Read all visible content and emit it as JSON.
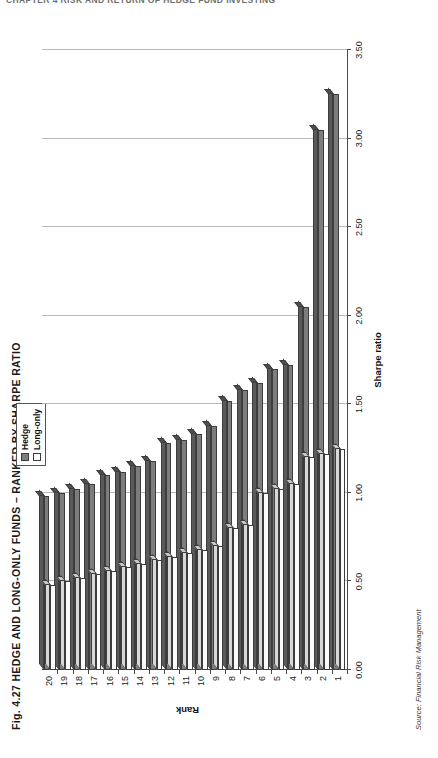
{
  "running_header": "CHAPTER 4  RISK AND RETURN OF HEDGE FUND INVESTING",
  "figure": {
    "title": "Fig. 4.27 HEDGE AND LONG-ONLY FUNDS – RANKED BY SHARPE RATIO",
    "source": "Source: Financial Risk Management"
  },
  "legend": {
    "position": "top-center",
    "items": [
      {
        "label": "Hedge",
        "color": "#7d7d7d",
        "swatch": "filled-gray-square"
      },
      {
        "label": "Long-only",
        "color": "#ffffff",
        "swatch": "empty-white-square"
      }
    ]
  },
  "chart_data": {
    "type": "bar",
    "orientation": "horizontal",
    "title": "Fig. 4.27 HEDGE AND LONG-ONLY FUNDS – RANKED BY SHARPE RATIO",
    "xlabel": "Sharpe ratio",
    "ylabel": "Rank",
    "xlim": [
      0.0,
      3.5
    ],
    "xticks": [
      0.0,
      0.5,
      1.0,
      1.5,
      2.0,
      2.5,
      3.0,
      3.5
    ],
    "xticklabels": [
      "0.00",
      "0.50",
      "1.00",
      "1.50",
      "2.00",
      "2.50",
      "3.00",
      "3.50"
    ],
    "grid": true,
    "grid_axis": "x",
    "legend_position": "top-center",
    "categories": [
      "1",
      "2",
      "3",
      "4",
      "5",
      "6",
      "7",
      "8",
      "9",
      "10",
      "11",
      "12",
      "13",
      "14",
      "15",
      "16",
      "17",
      "18",
      "19",
      "20"
    ],
    "series": [
      {
        "name": "Hedge",
        "color": "#7d7d7d",
        "values": [
          3.25,
          3.05,
          2.05,
          1.72,
          1.7,
          1.62,
          1.58,
          1.52,
          1.38,
          1.33,
          1.3,
          1.28,
          1.18,
          1.15,
          1.12,
          1.1,
          1.05,
          1.02,
          1.0,
          0.98
        ]
      },
      {
        "name": "Long-only",
        "color": "#ffffff",
        "values": [
          1.25,
          1.22,
          1.2,
          1.05,
          1.02,
          1.0,
          0.82,
          0.8,
          0.7,
          0.68,
          0.66,
          0.64,
          0.62,
          0.6,
          0.58,
          0.56,
          0.54,
          0.52,
          0.5,
          0.48
        ]
      }
    ]
  }
}
